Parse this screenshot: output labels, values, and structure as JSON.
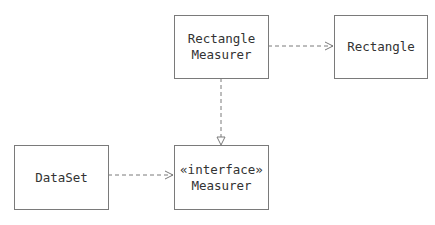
{
  "diagram": {
    "type": "uml-class",
    "nodes": [
      {
        "id": "rectangle_measurer",
        "lines": [
          "Rectangle",
          "Measurer"
        ]
      },
      {
        "id": "rectangle",
        "lines": [
          "Rectangle"
        ]
      },
      {
        "id": "dataset",
        "lines": [
          "DataSet"
        ]
      },
      {
        "id": "measurer",
        "lines": [
          "«interface»",
          "Measurer"
        ]
      }
    ],
    "edges": [
      {
        "from": "rectangle_measurer",
        "to": "rectangle",
        "kind": "dependency"
      },
      {
        "from": "rectangle_measurer",
        "to": "measurer",
        "kind": "realization"
      },
      {
        "from": "dataset",
        "to": "measurer",
        "kind": "dependency"
      }
    ]
  },
  "colors": {
    "line": "#7a7a7a",
    "text": "#333333",
    "background": "#ffffff"
  }
}
